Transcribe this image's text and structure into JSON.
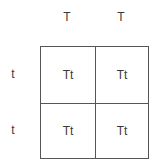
{
  "punnett_square": {
    "column_alleles": [
      "T",
      "T"
    ],
    "row_alleles": [
      "t",
      "t"
    ],
    "cells": [
      [
        "Tt",
        "Tt"
      ],
      [
        "Tt",
        "Tt"
      ]
    ]
  },
  "colors": {
    "grid_line": "#555555",
    "text": "#3a3a3a",
    "background": "#ffffff"
  }
}
